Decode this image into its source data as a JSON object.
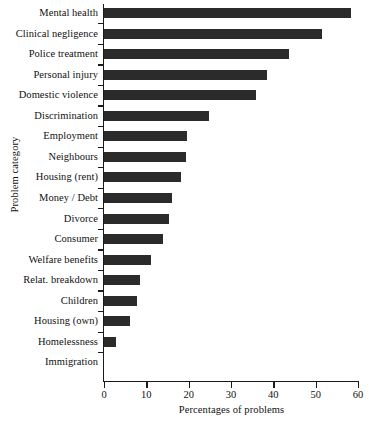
{
  "chart_data": {
    "type": "bar",
    "orientation": "horizontal",
    "title": "",
    "xlabel": "Percentages of problems",
    "ylabel": "Problem category",
    "xlim": [
      0,
      60
    ],
    "xticks": [
      0,
      10,
      20,
      30,
      40,
      50,
      60
    ],
    "grid": false,
    "legend": null,
    "bar_color": "#2b2b2b",
    "axis_color": "#1a1a1a",
    "categories": [
      "Mental health",
      "Clinical negligence",
      "Police treatment",
      "Personal injury",
      "Domestic violence",
      "Discrimination",
      "Employment",
      "Neighbours",
      "Housing (rent)",
      "Money / Debt",
      "Divorce",
      "Consumer",
      "Welfare benefits",
      "Relat. breakdown",
      "Children",
      "Housing (own)",
      "Homelessness",
      "Immigration"
    ],
    "values": [
      58.3,
      51.4,
      43.7,
      38.4,
      35.8,
      24.9,
      19.5,
      19.3,
      18.1,
      16.1,
      15.3,
      14.0,
      11.0,
      8.6,
      7.8,
      6.1,
      2.8,
      0.0
    ]
  }
}
